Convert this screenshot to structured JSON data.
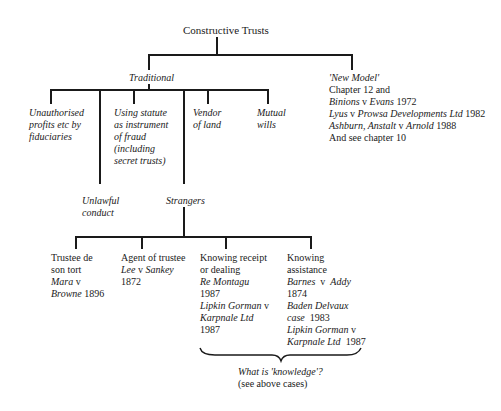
{
  "title": "Constructive Trusts",
  "branches": {
    "traditional": {
      "label": "Traditional",
      "children": {
        "unauthorised": [
          "Unauthorised",
          "profits etc by",
          "fiduciaries"
        ],
        "unlawful": [
          "Unlawful",
          "conduct"
        ],
        "statute": [
          "Using statute",
          "as instrument",
          "of fraud",
          "(including",
          "secret trusts)"
        ],
        "strangers": "Strangers",
        "vendor": [
          "Vendor",
          "of land"
        ],
        "mutual": [
          "Mutual",
          "wills"
        ]
      }
    },
    "new_model": {
      "label": "'New Model'",
      "lines": [
        {
          "text": "Chapter 12 and"
        },
        {
          "a": "Binions",
          "v": " v ",
          "b": "Evans",
          "year": " 1972"
        },
        {
          "a": "Lyus",
          "v": " v ",
          "b": "Prowsa Developments Ltd",
          "year": " 1982"
        },
        {
          "a": "Ashburn, Anstalt",
          "v": " v ",
          "b": "Arnold",
          "year": " 1988"
        },
        {
          "text": "And see chapter 10"
        }
      ]
    }
  },
  "strangers": {
    "trustee_de_son_tort": {
      "heading": [
        "Trustee de",
        "son tort"
      ],
      "case_a": "Mara",
      "v": " v",
      "case_b": "Browne",
      "year": " 1896"
    },
    "agent_of_trustee": {
      "heading": "Agent of trustee",
      "case_a": "Lee",
      "v": " v ",
      "case_b": "Sankey",
      "year": "1872"
    },
    "knowing_receipt": {
      "heading": [
        "Knowing receipt",
        "or dealing"
      ],
      "case1": "Re Montagu",
      "year1": "1987",
      "case2_a": "Lipkin Gorman",
      "v": " v",
      "case2_b": "Karpnale Ltd",
      "year2": "1987"
    },
    "knowing_assistance": {
      "heading": [
        "Knowing",
        "assistance"
      ],
      "case1_a": "Barnes",
      "v1": "  v  ",
      "case1_b": "Addy",
      "year1": "1874",
      "case2": "Baden Delvaux",
      "case2_b": "case",
      "year2": "  1983",
      "case3_a": "Lipkin Gorman",
      "v3": " v",
      "case3_b": "Karpnale Ltd",
      "year3": "  1987"
    }
  },
  "knowledge_note": {
    "question": "What is 'knowledge'?",
    "sub": "(see above cases)"
  }
}
